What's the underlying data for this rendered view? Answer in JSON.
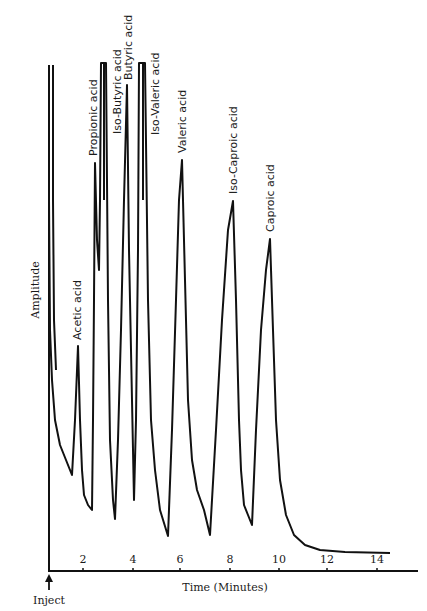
{
  "chart_data": {
    "type": "line",
    "title": "",
    "xlabel": "Time (Minutes)",
    "ylabel": "Amplitude",
    "xlim": [
      0,
      15.5
    ],
    "x_ticks": [
      2,
      4,
      6,
      8,
      10,
      12,
      14
    ],
    "x_tick_labels": [
      "2",
      "4",
      "6",
      "8",
      "10",
      "12",
      "14"
    ],
    "grid": false,
    "legend": null,
    "annotations": [
      {
        "text": "Inject",
        "x": 0,
        "marker": "arrow-up"
      }
    ],
    "peaks": [
      {
        "name": "Solvent",
        "time": 0.1,
        "relative_height": "off-scale"
      },
      {
        "name": "Acetic acid",
        "time": 1.2,
        "relative_height": 0.45
      },
      {
        "name": "Propionic acid",
        "time": 1.9,
        "relative_height": 0.81
      },
      {
        "name": "Iso-Butyric acid",
        "time": 2.2,
        "relative_height": "off-scale"
      },
      {
        "name": "Butyric acid",
        "time": 3.2,
        "relative_height": 0.96
      },
      {
        "name": "Iso-Valeric acid",
        "time": 3.8,
        "relative_height": "off-scale"
      },
      {
        "name": "Valeric acid",
        "time": 5.4,
        "relative_height": 0.81
      },
      {
        "name": "Iso-Caproic acid",
        "time": 7.5,
        "relative_height": 0.73
      },
      {
        "name": "Caproic acid",
        "time": 9.0,
        "relative_height": 0.65
      }
    ]
  },
  "labels": {
    "ylabel": "Amplitude",
    "xlabel": "Time (Minutes)",
    "inject": "Inject",
    "peaks": [
      "Acetic acid",
      "Propionic acid",
      "Iso-Butyric acid",
      "Butyric acid",
      "Iso-Valeric acid",
      "Valeric acid",
      "Iso-Caproic acid",
      "Caproic acid"
    ],
    "ticks": [
      "2",
      "4",
      "6",
      "8",
      "10",
      "12",
      "14"
    ]
  },
  "trace": [
    [
      49,
      65
    ],
    [
      49,
      200
    ],
    [
      50,
      330
    ],
    [
      52,
      380
    ],
    [
      55,
      420
    ],
    [
      60,
      445
    ],
    [
      66,
      460
    ],
    [
      72,
      475
    ],
    [
      75,
      420
    ],
    [
      78,
      346
    ],
    [
      80,
      420
    ],
    [
      82,
      470
    ],
    [
      84,
      495
    ],
    [
      88,
      505
    ],
    [
      92,
      510
    ],
    [
      93,
      420
    ],
    [
      94,
      300
    ],
    [
      95,
      163
    ],
    [
      97,
      240
    ],
    [
      99,
      270
    ],
    [
      100,
      200
    ],
    [
      101,
      63
    ],
    [
      106,
      63
    ],
    [
      108,
      300
    ],
    [
      110,
      440
    ],
    [
      113,
      500
    ],
    [
      115,
      519
    ],
    [
      118,
      440
    ],
    [
      121,
      330
    ],
    [
      124,
      200
    ],
    [
      127,
      85
    ],
    [
      129,
      250
    ],
    [
      132,
      400
    ],
    [
      134,
      500
    ],
    [
      136,
      420
    ],
    [
      138,
      250
    ],
    [
      139,
      63
    ],
    [
      145,
      63
    ],
    [
      148,
      300
    ],
    [
      151,
      420
    ],
    [
      155,
      470
    ],
    [
      160,
      510
    ],
    [
      168,
      536
    ],
    [
      172,
      430
    ],
    [
      176,
      300
    ],
    [
      179,
      200
    ],
    [
      182,
      160
    ],
    [
      185,
      280
    ],
    [
      188,
      400
    ],
    [
      192,
      460
    ],
    [
      197,
      490
    ],
    [
      204,
      510
    ],
    [
      210,
      535
    ],
    [
      216,
      430
    ],
    [
      222,
      320
    ],
    [
      228,
      230
    ],
    [
      233,
      201
    ],
    [
      236,
      300
    ],
    [
      239,
      420
    ],
    [
      241,
      470
    ],
    [
      244,
      505
    ],
    [
      248,
      515
    ],
    [
      252,
      525
    ],
    [
      256,
      430
    ],
    [
      261,
      330
    ],
    [
      266,
      270
    ],
    [
      270,
      239
    ],
    [
      273,
      330
    ],
    [
      276,
      420
    ],
    [
      280,
      480
    ],
    [
      286,
      515
    ],
    [
      294,
      535
    ],
    [
      305,
      545
    ],
    [
      320,
      550
    ],
    [
      345,
      552
    ],
    [
      390,
      553
    ]
  ],
  "trace2": [
    [
      53,
      65
    ],
    [
      53,
      200
    ],
    [
      54,
      320
    ],
    [
      56,
      370
    ]
  ]
}
